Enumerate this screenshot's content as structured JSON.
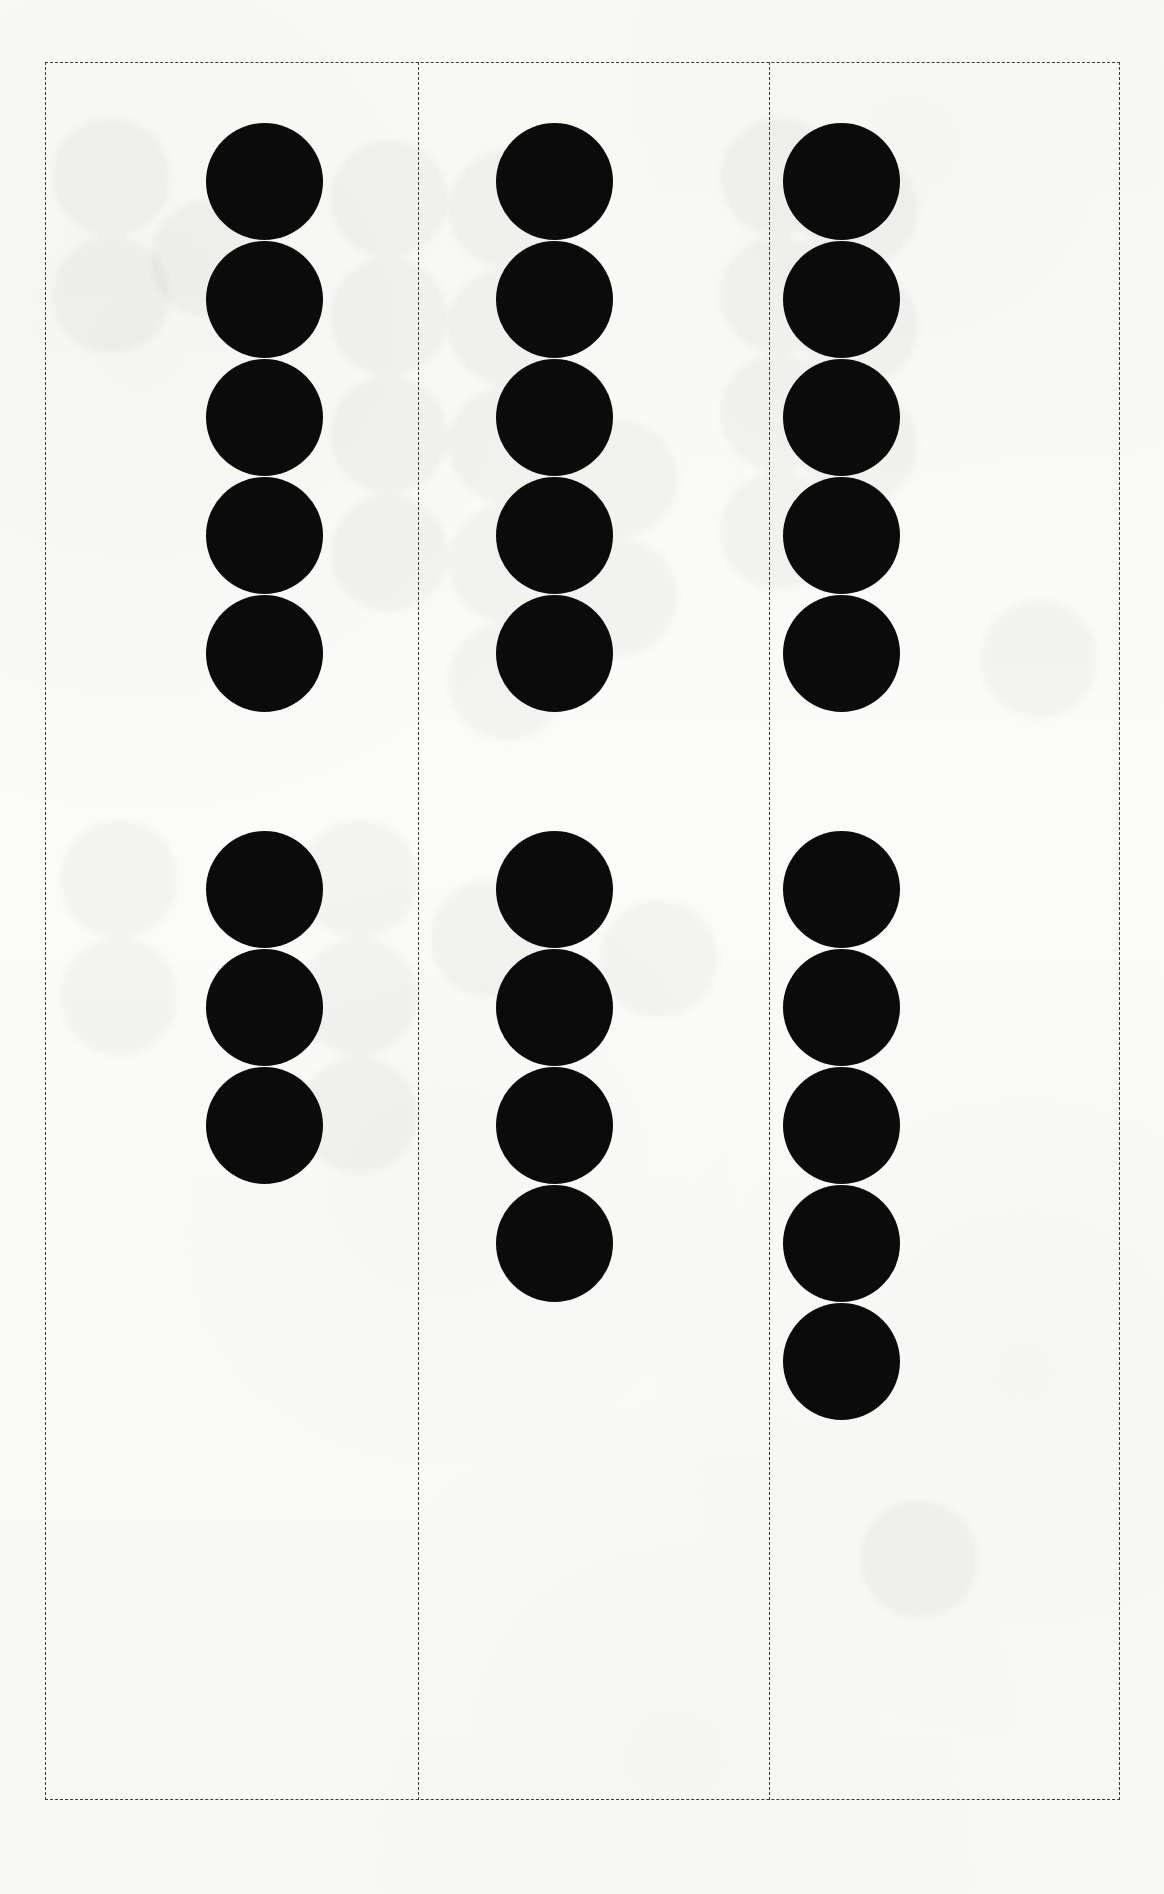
{
  "document": {
    "kind": "dot-tally-worksheet",
    "page_width": 1164,
    "page_height": 1894,
    "background_color": "#fdfdfc",
    "ink_color": "#0b0b0b",
    "rule_color": "#3a3a3a"
  },
  "frame": {
    "style": "dashed",
    "x": 45,
    "y": 62,
    "width": 1075,
    "height": 1738
  },
  "dividers": [
    {
      "name": "divider-1",
      "x": 418,
      "y": 62,
      "height": 1738
    },
    {
      "name": "divider-2",
      "x": 769,
      "y": 62,
      "height": 1738
    }
  ],
  "dot_geometry": {
    "diameter": 117,
    "vertical_pitch": 118
  },
  "ghosts": [
    {
      "x": 52,
      "y": 118,
      "d": 118
    },
    {
      "x": 52,
      "y": 236,
      "d": 118
    },
    {
      "x": 150,
      "y": 200,
      "d": 118
    },
    {
      "x": 330,
      "y": 140,
      "d": 118
    },
    {
      "x": 330,
      "y": 258,
      "d": 118
    },
    {
      "x": 330,
      "y": 376,
      "d": 118
    },
    {
      "x": 330,
      "y": 494,
      "d": 118
    },
    {
      "x": 448,
      "y": 150,
      "d": 118
    },
    {
      "x": 448,
      "y": 268,
      "d": 118
    },
    {
      "x": 448,
      "y": 386,
      "d": 118
    },
    {
      "x": 448,
      "y": 504,
      "d": 118
    },
    {
      "x": 448,
      "y": 622,
      "d": 118
    },
    {
      "x": 560,
      "y": 420,
      "d": 118
    },
    {
      "x": 560,
      "y": 538,
      "d": 118
    },
    {
      "x": 720,
      "y": 118,
      "d": 118
    },
    {
      "x": 720,
      "y": 236,
      "d": 118
    },
    {
      "x": 720,
      "y": 354,
      "d": 118
    },
    {
      "x": 720,
      "y": 472,
      "d": 118
    },
    {
      "x": 800,
      "y": 150,
      "d": 118
    },
    {
      "x": 800,
      "y": 268,
      "d": 118
    },
    {
      "x": 800,
      "y": 386,
      "d": 118
    },
    {
      "x": 60,
      "y": 820,
      "d": 118
    },
    {
      "x": 60,
      "y": 938,
      "d": 118
    },
    {
      "x": 300,
      "y": 820,
      "d": 118
    },
    {
      "x": 300,
      "y": 938,
      "d": 118
    },
    {
      "x": 300,
      "y": 1056,
      "d": 118
    },
    {
      "x": 430,
      "y": 880,
      "d": 118
    },
    {
      "x": 600,
      "y": 900,
      "d": 118
    },
    {
      "x": 860,
      "y": 1500,
      "d": 118
    },
    {
      "x": 980,
      "y": 600,
      "d": 118
    }
  ],
  "columns": [
    {
      "name": "column-1",
      "center_x": 206,
      "groups": [
        {
          "name": "group-top",
          "count": 5,
          "start_y": 123
        },
        {
          "name": "group-bottom",
          "count": 3,
          "start_y": 831
        }
      ]
    },
    {
      "name": "column-2",
      "center_x": 496,
      "groups": [
        {
          "name": "group-top",
          "count": 5,
          "start_y": 123
        },
        {
          "name": "group-bottom",
          "count": 4,
          "start_y": 831
        }
      ]
    },
    {
      "name": "column-3",
      "center_x": 783,
      "groups": [
        {
          "name": "group-top",
          "count": 5,
          "start_y": 123
        },
        {
          "name": "group-bottom",
          "count": 5,
          "start_y": 831
        }
      ]
    }
  ],
  "chart_data": {
    "type": "bar",
    "title": "",
    "xlabel": "",
    "ylabel": "",
    "orientation": "vertical-dot-stack",
    "categories": [
      "Column 1",
      "Column 2",
      "Column 3"
    ],
    "series": [
      {
        "name": "Top group",
        "values": [
          5,
          5,
          5
        ]
      },
      {
        "name": "Bottom group",
        "values": [
          3,
          4,
          5
        ]
      }
    ],
    "unit": "dots",
    "ylim": [
      0,
      5
    ],
    "grid": false,
    "legend": "none"
  }
}
